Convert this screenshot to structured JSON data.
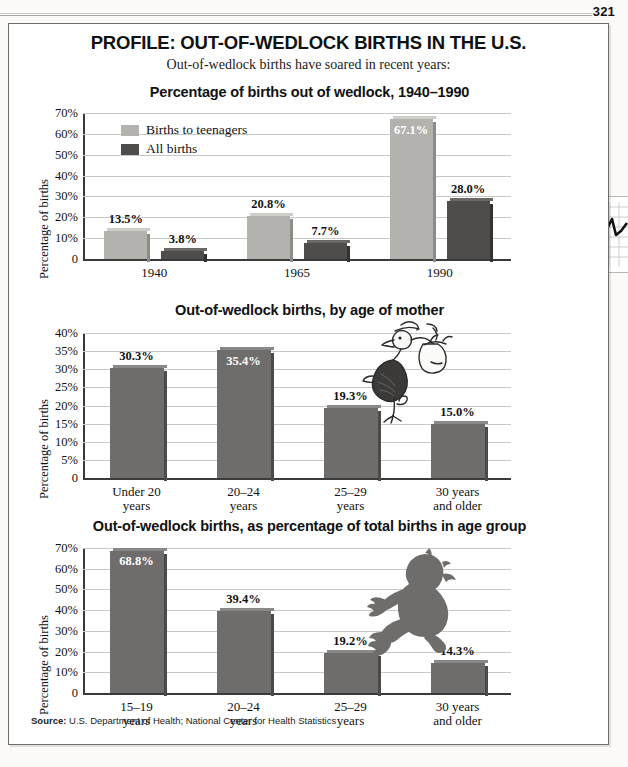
{
  "page": {
    "number": "321"
  },
  "header": {
    "title": "PROFILE: OUT-OF-WEDLOCK BIRTHS IN THE U.S.",
    "subtitle": "Out-of-wedlock births have soared in recent years:"
  },
  "source": {
    "label": "Source:",
    "text": "U.S. Department of Health; National Center for Health Statistics"
  },
  "colors": {
    "light_bar": "#b4b2af",
    "dark_bar": "#4f4d4b",
    "mid_bar": "#6f6d6b",
    "grid": "#c8c8c8",
    "axis": "#3a3a3a",
    "frame": "#6f6d6a"
  },
  "art": {
    "stork": "stork-carrying-bundle-illustration",
    "baby": "crawling-baby-silhouette"
  },
  "chart_data": [
    {
      "type": "bar",
      "title": "Percentage of births out of wedlock, 1940–1990",
      "ylabel": "Percentage of births",
      "xlabel": "",
      "categories": [
        "1940",
        "1965",
        "1990"
      ],
      "series": [
        {
          "name": "Births to teenagers",
          "values": [
            13.5,
            20.8,
            67.1
          ],
          "labels": [
            "13.5%",
            "20.8%",
            "67.1%"
          ],
          "color": "#b4b2af"
        },
        {
          "name": "All births",
          "values": [
            3.8,
            7.7,
            28.0
          ],
          "labels": [
            "3.8%",
            "7.7%",
            "28.0%"
          ],
          "color": "#4f4d4b"
        }
      ],
      "ylim": [
        0,
        70
      ],
      "yticks": [
        "0",
        "10%",
        "20%",
        "30%",
        "40%",
        "50%",
        "60%",
        "70%"
      ],
      "grid": true,
      "legend": [
        "Births to teenagers",
        "All births"
      ],
      "legend_position": "inside-top-left"
    },
    {
      "type": "bar",
      "title": "Out-of-wedlock births, by age of mother",
      "ylabel": "Percentage of births",
      "xlabel": "",
      "categories": [
        "Under 20\nyears",
        "20–24\nyears",
        "25–29\nyears",
        "30 years\nand older"
      ],
      "values": [
        30.3,
        35.4,
        19.3,
        15.0
      ],
      "labels": [
        "30.3%",
        "35.4%",
        "19.3%",
        "15.0%"
      ],
      "ylim": [
        0,
        40
      ],
      "yticks": [
        "0",
        "5%",
        "10%",
        "15%",
        "20%",
        "25%",
        "30%",
        "35%",
        "40%"
      ],
      "grid": true,
      "legend_position": "none"
    },
    {
      "type": "bar",
      "title": "Out-of-wedlock births, as percentage of total births in age group",
      "ylabel": "Percentage of births",
      "xlabel": "",
      "categories": [
        "15–19\nyears",
        "20–24\nyears",
        "25–29\nyears",
        "30 years\nand older"
      ],
      "values": [
        68.8,
        39.4,
        19.2,
        14.3
      ],
      "labels": [
        "68.8%",
        "39.4%",
        "19.2%",
        "14.3%"
      ],
      "ylim": [
        0,
        70
      ],
      "yticks": [
        "0",
        "10%",
        "20%",
        "30%",
        "40%",
        "50%",
        "60%",
        "70%"
      ],
      "grid": true,
      "legend_position": "none"
    }
  ]
}
